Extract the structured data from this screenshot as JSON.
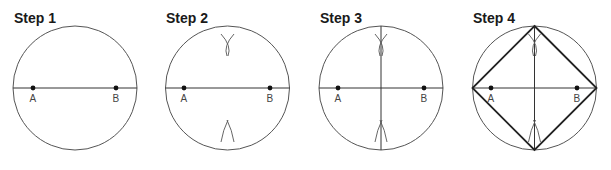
{
  "figure": {
    "panels": [
      {
        "title": "Step 1",
        "cx": 75,
        "cy": 88,
        "r": 62,
        "ax": 33,
        "bx": 116,
        "label_a": "A",
        "label_b": "B"
      },
      {
        "title": "Step 2",
        "cx": 227.5,
        "cy": 88,
        "r": 62,
        "ax": 184,
        "bx": 270,
        "label_a": "A",
        "label_b": "B"
      },
      {
        "title": "Step 3",
        "cx": 381,
        "cy": 88,
        "r": 62,
        "ax": 338,
        "bx": 424,
        "label_a": "A",
        "label_b": "B"
      },
      {
        "title": "Step 4",
        "cx": 534.5,
        "cy": 88,
        "r": 62,
        "ax": 491,
        "bx": 577,
        "label_a": "A",
        "label_b": "B"
      }
    ],
    "colors": {
      "stroke": "#555555",
      "square": "#222222",
      "text": "#1a1a1a"
    }
  }
}
